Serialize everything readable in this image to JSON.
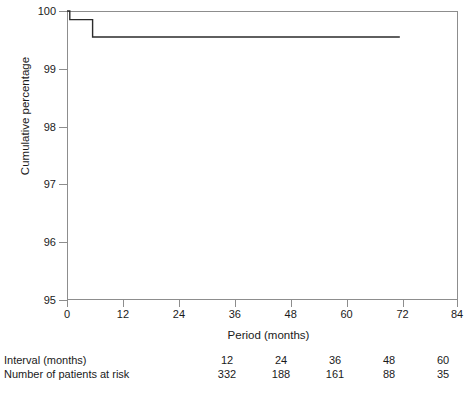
{
  "chart_data": {
    "type": "line",
    "subtype": "kaplan-meier-step",
    "title": "",
    "xlabel": "Period (months)",
    "ylabel": "Cumulative percentage",
    "xlim": [
      0,
      84
    ],
    "ylim": [
      95,
      100
    ],
    "xticks": [
      0,
      12,
      24,
      36,
      48,
      60,
      72,
      84
    ],
    "xticklabels": [
      "0",
      "12",
      "24",
      "36",
      "48",
      "60",
      "72",
      "84"
    ],
    "yticks": [
      95,
      96,
      97,
      98,
      99,
      100
    ],
    "yticklabels": [
      "95",
      "96",
      "97",
      "98",
      "99",
      "100"
    ],
    "grid": false,
    "legend": null,
    "frame": "box",
    "series": [
      {
        "name": "Cumulative percentage",
        "step": "post",
        "color": "#2b2b2b",
        "x": [
          0.0,
          0.6,
          0.6,
          5.5,
          5.5,
          71.5
        ],
        "y": [
          100.0,
          100.0,
          99.85,
          99.85,
          99.55,
          99.55
        ]
      }
    ],
    "events": [
      {
        "x": 0.6,
        "from": 100.0,
        "to": 99.85
      },
      {
        "x": 5.5,
        "from": 99.85,
        "to": 99.55
      }
    ],
    "risk_table": {
      "row_labels": [
        "Interval (months)",
        "Number of patients at risk"
      ],
      "intervals": [
        "12",
        "24",
        "36",
        "48",
        "60"
      ],
      "at_risk": [
        "332",
        "188",
        "161",
        "88",
        "35"
      ]
    }
  },
  "axes": {
    "y_title": "Cumulative percentage",
    "x_title": "Period (months)",
    "y_labels": [
      "100",
      "99",
      "98",
      "97",
      "96",
      "95"
    ],
    "x_labels": [
      "0",
      "12",
      "24",
      "36",
      "48",
      "60",
      "72",
      "84"
    ]
  },
  "risk_table": {
    "label_interval": "Interval (months)",
    "label_at_risk": "Number of patients at risk",
    "intervals": [
      "12",
      "24",
      "36",
      "48",
      "60"
    ],
    "at_risk": [
      "332",
      "188",
      "161",
      "88",
      "35"
    ]
  },
  "colors": {
    "curve": "#2b2b2b",
    "axis": "#8d8d8d",
    "text": "#1a1a1a",
    "background": "#ffffff"
  }
}
